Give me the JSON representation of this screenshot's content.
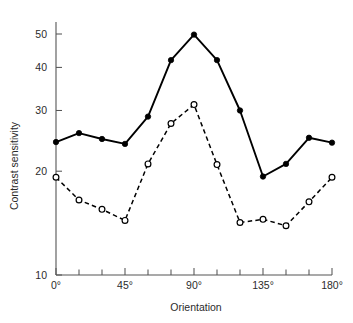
{
  "chart_data": {
    "type": "line",
    "title": "",
    "xlabel": "Orientation",
    "ylabel": "Contrast sensitivity",
    "x": [
      0,
      15,
      30,
      45,
      60,
      75,
      90,
      105,
      120,
      135,
      150,
      165,
      180
    ],
    "xtick_labels_all": [
      "0°",
      "",
      "",
      "45°",
      "",
      "",
      "90°",
      "",
      "",
      "135°",
      "",
      "",
      "180°"
    ],
    "xtick_labels_shown": [
      "0°",
      "45°",
      "90°",
      "135°",
      "180°"
    ],
    "xtick_values_shown": [
      0,
      45,
      90,
      135,
      180
    ],
    "xlim": [
      0,
      180
    ],
    "ylim": [
      10,
      52
    ],
    "yscale": "log",
    "ytick_labels": [
      "10",
      "20",
      "30",
      "40",
      "50"
    ],
    "ytick_values": [
      10,
      20,
      30,
      40,
      50
    ],
    "grid": false,
    "legend": "none",
    "series": [
      {
        "name": "solid-filled-circles",
        "marker": "filled-circle",
        "linestyle": "solid",
        "color": "#000000",
        "values": [
          24.3,
          25.8,
          24.8,
          24.0,
          28.8,
          42.0,
          49.8,
          42.0,
          30.0,
          19.3,
          21.0,
          25.0,
          24.2
        ]
      },
      {
        "name": "dashed-open-circles",
        "marker": "open-circle",
        "linestyle": "dashed",
        "color": "#000000",
        "values": [
          19.2,
          16.5,
          15.5,
          14.4,
          21.0,
          27.5,
          31.2,
          20.9,
          14.2,
          14.5,
          13.9,
          16.3,
          19.2
        ]
      }
    ]
  },
  "axes": {
    "x_title": "Orientation",
    "y_title": "Contrast sensitivity"
  }
}
